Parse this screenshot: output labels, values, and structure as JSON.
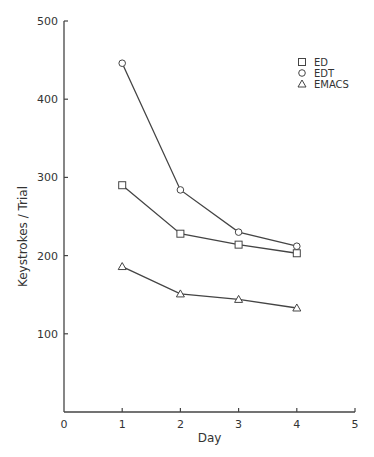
{
  "chart_data": {
    "type": "line",
    "title": "",
    "xlabel": "Day",
    "ylabel": "Keystrokes / Trial",
    "x": [
      1,
      2,
      3,
      4
    ],
    "xlim": [
      0,
      5
    ],
    "ylim": [
      0,
      500
    ],
    "x_ticks": [
      "0",
      "1",
      "2",
      "3",
      "4",
      "5"
    ],
    "y_ticks": [
      "100",
      "200",
      "300",
      "400",
      "500"
    ],
    "grid": false,
    "legend_position": "upper right",
    "series": [
      {
        "name": "ED",
        "marker": "square",
        "values": [
          290,
          228,
          214,
          203
        ]
      },
      {
        "name": "EDT",
        "marker": "circle",
        "values": [
          446,
          284,
          230,
          212
        ]
      },
      {
        "name": "EMACS",
        "marker": "triangle",
        "values": [
          186,
          151,
          144,
          133
        ]
      }
    ]
  }
}
